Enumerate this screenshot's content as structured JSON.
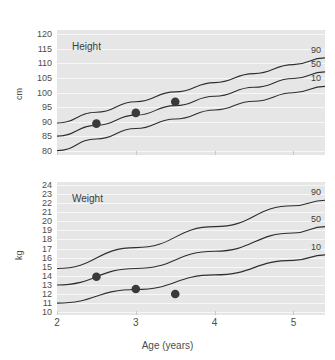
{
  "chart_data": [
    {
      "type": "line",
      "title": "Height",
      "xlabel": "Age (years)",
      "ylabel": "cm",
      "xlim": [
        2,
        5.4
      ],
      "ylim": [
        78.5,
        121.5
      ],
      "xticks": [
        2,
        3,
        4,
        5
      ],
      "yticks": [
        80,
        85,
        90,
        95,
        100,
        105,
        110,
        115,
        120
      ],
      "grid": true,
      "legend_position": "right-inline",
      "series": [
        {
          "name": "90",
          "label": "90",
          "x": [
            2,
            2.5,
            3,
            3.5,
            4,
            4.5,
            5,
            5.4
          ],
          "values": [
            89.5,
            93.2,
            96.8,
            100.2,
            103.4,
            106.5,
            109.6,
            111.9
          ]
        },
        {
          "name": "50",
          "label": "50",
          "x": [
            2,
            2.5,
            3,
            3.5,
            4,
            4.5,
            5,
            5.4
          ],
          "values": [
            85.0,
            88.7,
            92.2,
            95.5,
            98.7,
            101.8,
            104.8,
            107.1
          ]
        },
        {
          "name": "10",
          "label": "10",
          "x": [
            2,
            2.5,
            3,
            3.5,
            4,
            4.5,
            5,
            5.4
          ],
          "values": [
            80.0,
            84.0,
            87.6,
            90.9,
            94.0,
            97.0,
            99.9,
            102.1
          ]
        }
      ],
      "points": {
        "name": "measurements",
        "x": [
          2.5,
          3.0,
          3.5
        ],
        "values": [
          89.3,
          93.0,
          96.8
        ]
      }
    },
    {
      "type": "line",
      "title": "Weight",
      "xlabel": "Age (years)",
      "ylabel": "kg",
      "xlim": [
        2,
        5.4
      ],
      "ylim": [
        9.7,
        24.3
      ],
      "xticks": [
        2,
        3,
        4,
        5
      ],
      "yticks": [
        10,
        11,
        12,
        13,
        14,
        15,
        16,
        17,
        18,
        19,
        20,
        21,
        22,
        23,
        24
      ],
      "grid": true,
      "legend_position": "right-inline",
      "series": [
        {
          "name": "90",
          "label": "90",
          "x": [
            2,
            3,
            4,
            5,
            5.4
          ],
          "values": [
            14.8,
            17.1,
            19.4,
            21.7,
            22.3
          ]
        },
        {
          "name": "50",
          "label": "50",
          "x": [
            2,
            3,
            4,
            5,
            5.4
          ],
          "values": [
            13.0,
            14.8,
            16.7,
            18.7,
            19.4
          ]
        },
        {
          "name": "10",
          "label": "10",
          "x": [
            2,
            3,
            4,
            5,
            5.4
          ],
          "values": [
            11.0,
            12.5,
            14.1,
            15.7,
            16.3
          ]
        }
      ],
      "points": {
        "name": "measurements",
        "x": [
          2.5,
          3.0,
          3.5
        ],
        "values": [
          13.9,
          12.55,
          12.0
        ]
      }
    }
  ],
  "colors": {
    "plot_background": "#e6e6e6",
    "gridline": "#f7f7f7",
    "curve": "#2e2e2e",
    "point": "#3a3a3a",
    "text": "#4d4d4d",
    "page_background": "#ffffff"
  },
  "height_panel": {
    "label": "Height",
    "y_axis_title": "cm",
    "yticks": [
      "120",
      "115",
      "110",
      "105",
      "100",
      "95",
      "90",
      "85",
      "80"
    ],
    "percentiles": [
      "90",
      "50",
      "10"
    ]
  },
  "weight_panel": {
    "label": "Weight",
    "y_axis_title": "kg",
    "yticks": [
      "24",
      "23",
      "22",
      "21",
      "20",
      "19",
      "18",
      "17",
      "16",
      "15",
      "14",
      "13",
      "12",
      "11",
      "10"
    ],
    "percentiles": [
      "90",
      "50",
      "10"
    ]
  },
  "x_axis": {
    "title": "Age (years)",
    "ticks": [
      "2",
      "3",
      "4",
      "5"
    ]
  }
}
